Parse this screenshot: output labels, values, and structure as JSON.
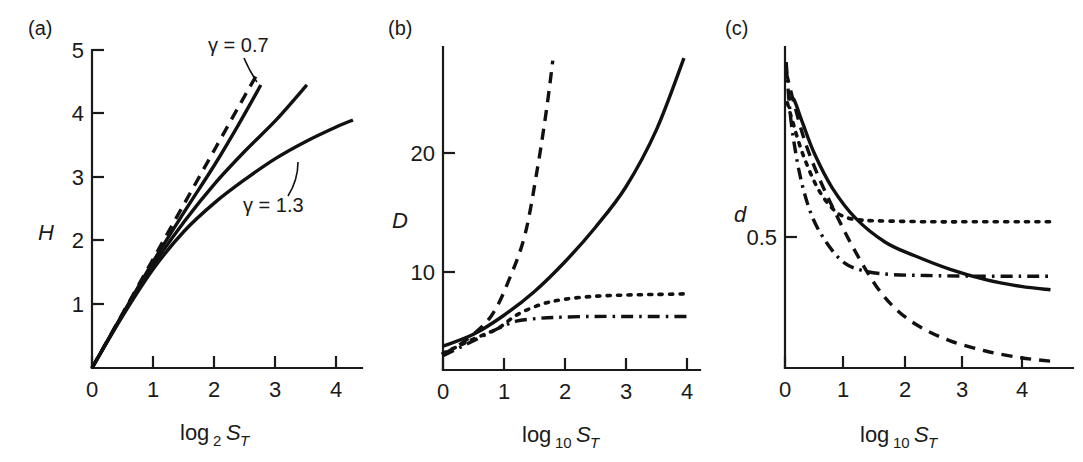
{
  "figure": {
    "panels": [
      {
        "id": "a",
        "letter": "(a)",
        "ylabel": "H",
        "xlabel_main": "log",
        "xlabel_sub": "2",
        "xlabel_var": "S",
        "xlabel_var_sub": "T",
        "xticks": [
          "0",
          "1",
          "2",
          "3",
          "4"
        ],
        "yticks": [
          "1",
          "2",
          "3",
          "4",
          "5"
        ],
        "annotations": [
          "γ = 0.7",
          "γ = 1.3"
        ]
      },
      {
        "id": "b",
        "letter": "(b)",
        "ylabel": "D",
        "xlabel_main": "log",
        "xlabel_sub": "10",
        "xlabel_var": "S",
        "xlabel_var_sub": "T",
        "xticks": [
          "0",
          "1",
          "2",
          "3",
          "4"
        ],
        "yticks": [
          "10",
          "20"
        ],
        "annotations": []
      },
      {
        "id": "c",
        "letter": "(c)",
        "ylabel": "d",
        "xlabel_main": "log",
        "xlabel_sub": "10",
        "xlabel_var": "S",
        "xlabel_var_sub": "T",
        "xticks": [
          "0",
          "1",
          "2",
          "3",
          "4"
        ],
        "yticks": [
          "0.5"
        ],
        "annotations": []
      }
    ]
  },
  "chart_data": [
    {
      "type": "line",
      "panel": "a",
      "title": "(a)",
      "xlabel": "log2 ST",
      "ylabel": "H",
      "xlim": [
        0,
        4.4
      ],
      "ylim": [
        0,
        5
      ],
      "xticks": [
        0,
        1,
        2,
        3,
        4
      ],
      "yticks": [
        1,
        2,
        3,
        4,
        5
      ],
      "grid": false,
      "legend": "none",
      "annotations": [
        {
          "text": "γ = 0.7",
          "x": 2.3,
          "y": 4.9
        },
        {
          "text": "γ = 1.3",
          "x": 3.4,
          "y": 2.55
        }
      ],
      "series": [
        {
          "name": "reference-linear",
          "style": "dashed",
          "x": [
            0,
            0.5,
            1.0,
            1.5,
            2.0,
            2.5,
            2.72
          ],
          "y": [
            0,
            0.86,
            1.72,
            2.58,
            3.44,
            4.3,
            4.67
          ]
        },
        {
          "name": "gamma-0.7",
          "style": "solid",
          "x": [
            0,
            0.5,
            1.0,
            1.5,
            2.0,
            2.4,
            2.75
          ],
          "y": [
            0,
            0.85,
            1.68,
            2.45,
            3.2,
            3.85,
            4.45
          ]
        },
        {
          "name": "gamma-1.0",
          "style": "solid",
          "x": [
            0,
            0.5,
            1.0,
            1.5,
            2.0,
            2.5,
            3.0,
            3.5
          ],
          "y": [
            0,
            0.84,
            1.62,
            2.3,
            2.9,
            3.42,
            3.9,
            4.45
          ]
        },
        {
          "name": "gamma-1.3",
          "style": "solid",
          "x": [
            0,
            0.5,
            1.0,
            1.5,
            2.0,
            2.5,
            3.0,
            3.5,
            4.0,
            4.25
          ],
          "y": [
            0,
            0.82,
            1.56,
            2.15,
            2.6,
            2.97,
            3.3,
            3.57,
            3.8,
            3.9
          ]
        }
      ]
    },
    {
      "type": "line",
      "panel": "b",
      "title": "(b)",
      "xlabel": "log10 ST",
      "ylabel": "D",
      "xlim": [
        0,
        4.5
      ],
      "ylim": [
        0,
        27
      ],
      "xticks": [
        0,
        1,
        2,
        3,
        4
      ],
      "yticks": [
        10,
        20
      ],
      "grid": false,
      "legend": "none",
      "annotations": [],
      "series": [
        {
          "name": "series-dashed",
          "style": "dashed",
          "x": [
            0,
            0.4,
            0.8,
            1.1,
            1.35,
            1.55,
            1.7,
            1.8
          ],
          "y": [
            1.3,
            2.6,
            4.6,
            7.8,
            11.5,
            17.0,
            22.0,
            26.0
          ]
        },
        {
          "name": "series-solid",
          "style": "solid",
          "x": [
            0,
            0.5,
            1.0,
            1.5,
            2.0,
            2.5,
            3.0,
            3.5,
            3.95
          ],
          "y": [
            2.0,
            3.0,
            4.6,
            6.6,
            9.1,
            12.0,
            15.4,
            20.2,
            26.2
          ]
        },
        {
          "name": "series-dotted",
          "style": "dotted",
          "x": [
            0,
            0.5,
            0.9,
            1.2,
            1.6,
            2.0,
            2.5,
            3.0,
            3.5,
            4.0
          ],
          "y": [
            1.4,
            2.6,
            3.5,
            4.6,
            5.5,
            5.95,
            6.2,
            6.3,
            6.35,
            6.4
          ]
        },
        {
          "name": "series-dashdot",
          "style": "dashdot",
          "x": [
            0,
            0.4,
            0.75,
            0.95,
            1.2,
            1.6,
            2.0,
            2.5,
            3.0,
            3.5,
            4.0
          ],
          "y": [
            1.2,
            2.2,
            3.1,
            3.6,
            4.1,
            4.35,
            4.45,
            4.5,
            4.5,
            4.5,
            4.5
          ]
        }
      ]
    },
    {
      "type": "line",
      "panel": "c",
      "title": "(c)",
      "xlabel": "log10 ST",
      "ylabel": "d",
      "xlim": [
        0,
        4.5
      ],
      "ylim": [
        0,
        0.95
      ],
      "xticks": [
        0,
        1,
        2,
        3,
        4
      ],
      "yticks": [
        0.5
      ],
      "grid": false,
      "legend": "none",
      "annotations": [],
      "series": [
        {
          "name": "series-solid",
          "style": "solid",
          "x": [
            0.07,
            0.15,
            0.3,
            0.5,
            0.8,
            1.2,
            1.7,
            2.2,
            2.8,
            3.4,
            4.0,
            4.5
          ],
          "y": [
            0.79,
            0.79,
            0.72,
            0.63,
            0.53,
            0.44,
            0.37,
            0.33,
            0.29,
            0.26,
            0.24,
            0.23
          ]
        },
        {
          "name": "series-dashed",
          "style": "dashed",
          "x": [
            0.02,
            0.15,
            0.35,
            0.6,
            0.9,
            1.2,
            1.55,
            1.9,
            2.3,
            2.8,
            3.4,
            4.0,
            4.5
          ],
          "y": [
            0.87,
            0.78,
            0.66,
            0.55,
            0.44,
            0.34,
            0.24,
            0.17,
            0.12,
            0.08,
            0.05,
            0.03,
            0.02
          ]
        },
        {
          "name": "series-dotted",
          "style": "dotted",
          "x": [
            0.04,
            0.12,
            0.3,
            0.55,
            0.8,
            1.0,
            1.3,
            1.8,
            2.5,
            3.2,
            4.0,
            4.5
          ],
          "y": [
            0.78,
            0.73,
            0.63,
            0.53,
            0.47,
            0.445,
            0.435,
            0.432,
            0.43,
            0.43,
            0.43,
            0.43
          ]
        },
        {
          "name": "series-dashdot",
          "style": "dashdot",
          "x": [
            0.02,
            0.1,
            0.25,
            0.45,
            0.7,
            1.0,
            1.35,
            1.8,
            2.4,
            3.2,
            4.0,
            4.5
          ],
          "y": [
            0.9,
            0.73,
            0.57,
            0.45,
            0.37,
            0.31,
            0.285,
            0.275,
            0.272,
            0.27,
            0.27,
            0.27
          ]
        }
      ]
    }
  ]
}
